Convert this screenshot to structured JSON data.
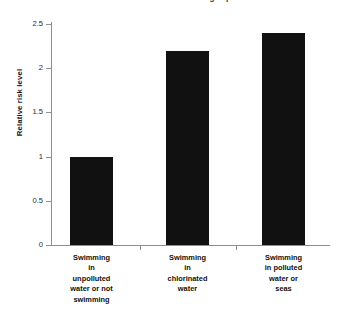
{
  "chart_data": {
    "type": "bar",
    "title": "Relative risks associated with swimming in polluted water",
    "xlabel": "",
    "ylabel": "Relative risk level",
    "categories": [
      "Swimming in unpolluted water or not swimming",
      "Swimming in chlorinated water",
      "Swimming in polluted water or seas"
    ],
    "category_lines": [
      [
        "Swimming",
        "in",
        "unpolluted",
        "water or not",
        "swimming"
      ],
      [
        "Swimming",
        "in",
        "chlorinated",
        "water"
      ],
      [
        "Swimming",
        "in polluted",
        "water or",
        "seas"
      ]
    ],
    "values": [
      1.0,
      2.2,
      2.4
    ],
    "ylim": [
      0,
      2.5
    ],
    "ytick_labels": [
      "0",
      "0.5",
      "1",
      "1.5",
      "2",
      "2.5"
    ],
    "ytick_values": [
      0,
      0.5,
      1,
      1.5,
      2,
      2.5
    ],
    "grid": false,
    "legend": false,
    "bar_color": "#111111",
    "axis_color": "#8d8d8d",
    "background_color": "#ffffff"
  }
}
